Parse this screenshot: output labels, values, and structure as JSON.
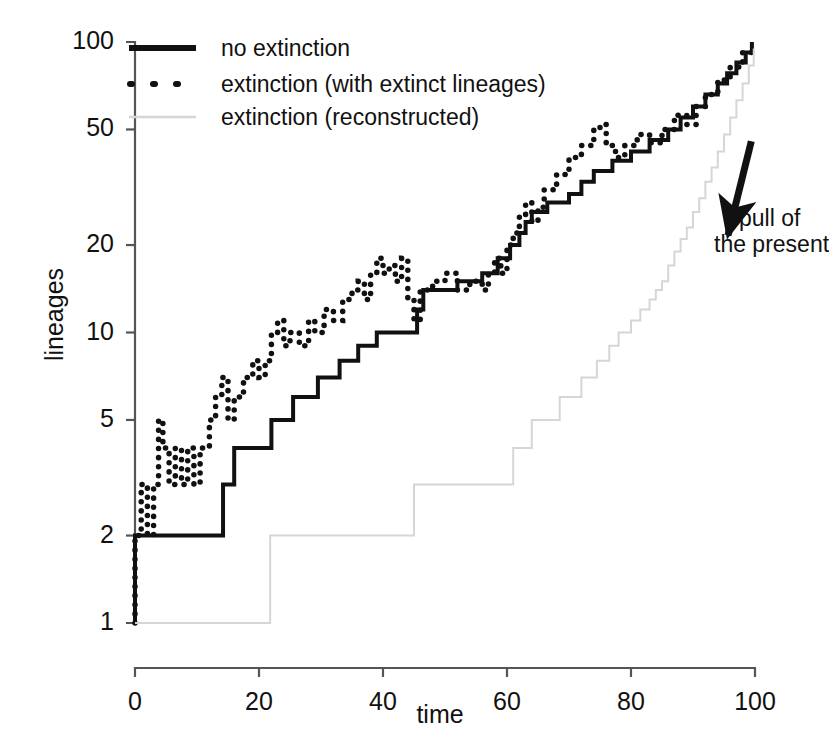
{
  "chart_data": {
    "type": "line",
    "title": "",
    "xlabel": "time",
    "ylabel": "lineages",
    "xlim": [
      0,
      100
    ],
    "ylim": [
      1,
      100
    ],
    "yscale": "log",
    "grid": false,
    "legend_position": "top-left",
    "xticks": [
      "0",
      "20",
      "40",
      "60",
      "80",
      "100"
    ],
    "xtick_values": [
      0,
      20,
      40,
      60,
      80,
      100
    ],
    "yticks": [
      "1",
      "2",
      "5",
      "10",
      "20",
      "50",
      "100"
    ],
    "ytick_values": [
      1,
      2,
      5,
      10,
      20,
      50,
      100
    ],
    "annotations": [
      {
        "name": "pull-of-the-present",
        "line1": "pull of",
        "line2": "the present",
        "arrow_from": [
          95,
          23
        ],
        "arrow_to": [
          96.5,
          47
        ]
      }
    ],
    "series": [
      {
        "name": "no extinction",
        "style": "solid",
        "color": "#111111",
        "width": 4,
        "step": true,
        "points": [
          [
            0,
            1
          ],
          [
            0,
            2
          ],
          [
            14.2,
            2
          ],
          [
            14.2,
            3
          ],
          [
            16.0,
            3
          ],
          [
            16.0,
            4
          ],
          [
            22.0,
            4
          ],
          [
            22.0,
            5
          ],
          [
            25.5,
            5
          ],
          [
            25.5,
            6
          ],
          [
            29.5,
            6
          ],
          [
            29.5,
            7
          ],
          [
            33.0,
            7
          ],
          [
            33.0,
            8
          ],
          [
            36.0,
            8
          ],
          [
            36.0,
            9
          ],
          [
            39.0,
            9
          ],
          [
            39.0,
            10
          ],
          [
            45.5,
            10
          ],
          [
            45.5,
            12
          ],
          [
            46.5,
            12
          ],
          [
            46.5,
            14
          ],
          [
            52.0,
            14
          ],
          [
            52.0,
            15
          ],
          [
            56.0,
            15
          ],
          [
            56.0,
            16
          ],
          [
            58.5,
            16
          ],
          [
            58.5,
            18
          ],
          [
            60.5,
            18
          ],
          [
            60.5,
            20
          ],
          [
            62.0,
            20
          ],
          [
            62.0,
            22
          ],
          [
            63.0,
            22
          ],
          [
            63.0,
            24
          ],
          [
            64.0,
            24
          ],
          [
            64.0,
            26
          ],
          [
            66.5,
            26
          ],
          [
            66.5,
            28
          ],
          [
            70.0,
            28
          ],
          [
            70.0,
            30
          ],
          [
            72.0,
            30
          ],
          [
            72.0,
            33
          ],
          [
            74.0,
            33
          ],
          [
            74.0,
            36
          ],
          [
            77.0,
            36
          ],
          [
            77.0,
            39
          ],
          [
            80.0,
            39
          ],
          [
            80.0,
            42
          ],
          [
            83.0,
            42
          ],
          [
            83.0,
            46
          ],
          [
            86.0,
            46
          ],
          [
            86.0,
            50
          ],
          [
            88.0,
            50
          ],
          [
            88.0,
            55
          ],
          [
            90.0,
            55
          ],
          [
            90.0,
            60
          ],
          [
            92.0,
            60
          ],
          [
            92.0,
            66
          ],
          [
            94.0,
            66
          ],
          [
            94.0,
            72
          ],
          [
            95.5,
            72
          ],
          [
            95.5,
            78
          ],
          [
            97.0,
            78
          ],
          [
            97.0,
            85
          ],
          [
            98.5,
            85
          ],
          [
            98.5,
            92
          ],
          [
            99.5,
            92
          ],
          [
            99.5,
            100
          ]
        ]
      },
      {
        "name": "extinction (with extinct lineages)",
        "style": "dotted",
        "color": "#111111",
        "width": 4,
        "step": true,
        "points": [
          [
            0,
            1
          ],
          [
            0,
            2
          ],
          [
            1.0,
            2
          ],
          [
            1.0,
            3
          ],
          [
            2.0,
            3
          ],
          [
            2.0,
            2
          ],
          [
            3.0,
            2
          ],
          [
            3.0,
            3
          ],
          [
            3.8,
            3
          ],
          [
            3.8,
            5
          ],
          [
            4.5,
            5
          ],
          [
            4.5,
            4
          ],
          [
            5.5,
            4
          ],
          [
            5.5,
            3
          ],
          [
            6.5,
            3
          ],
          [
            6.5,
            4
          ],
          [
            7.5,
            4
          ],
          [
            7.5,
            3
          ],
          [
            8.5,
            3
          ],
          [
            8.5,
            4
          ],
          [
            9.5,
            4
          ],
          [
            9.5,
            3
          ],
          [
            10.5,
            3
          ],
          [
            10.5,
            4
          ],
          [
            12.0,
            4
          ],
          [
            12.0,
            5
          ],
          [
            13.0,
            5
          ],
          [
            13.0,
            6
          ],
          [
            14.0,
            6
          ],
          [
            14.0,
            7
          ],
          [
            15.0,
            7
          ],
          [
            15.0,
            5
          ],
          [
            16.0,
            5
          ],
          [
            16.0,
            6
          ],
          [
            17.5,
            6
          ],
          [
            17.5,
            7
          ],
          [
            19.0,
            7
          ],
          [
            19.0,
            8
          ],
          [
            20.0,
            8
          ],
          [
            20.0,
            7
          ],
          [
            21.0,
            7
          ],
          [
            21.0,
            8
          ],
          [
            22.0,
            8
          ],
          [
            22.0,
            10
          ],
          [
            23.0,
            10
          ],
          [
            23.0,
            11
          ],
          [
            24.0,
            11
          ],
          [
            24.0,
            9
          ],
          [
            25.0,
            9
          ],
          [
            25.0,
            10
          ],
          [
            26.5,
            10
          ],
          [
            26.5,
            9
          ],
          [
            28.0,
            9
          ],
          [
            28.0,
            11
          ],
          [
            29.0,
            11
          ],
          [
            29.0,
            10
          ],
          [
            30.5,
            10
          ],
          [
            30.5,
            12
          ],
          [
            32.0,
            12
          ],
          [
            32.0,
            11
          ],
          [
            33.5,
            11
          ],
          [
            33.5,
            13
          ],
          [
            35.0,
            13
          ],
          [
            35.0,
            14
          ],
          [
            36.0,
            14
          ],
          [
            36.0,
            15
          ],
          [
            37.0,
            15
          ],
          [
            37.0,
            13
          ],
          [
            38.0,
            13
          ],
          [
            38.0,
            16
          ],
          [
            39.0,
            16
          ],
          [
            39.0,
            18
          ],
          [
            40.0,
            18
          ],
          [
            40.0,
            16
          ],
          [
            41.0,
            16
          ],
          [
            41.0,
            17
          ],
          [
            42.0,
            17
          ],
          [
            42.0,
            15
          ],
          [
            43.0,
            15
          ],
          [
            43.0,
            18
          ],
          [
            44.0,
            18
          ],
          [
            44.0,
            13
          ],
          [
            45.0,
            13
          ],
          [
            45.0,
            11
          ],
          [
            46.0,
            11
          ],
          [
            46.0,
            14
          ],
          [
            48.0,
            14
          ],
          [
            48.0,
            15
          ],
          [
            50.0,
            15
          ],
          [
            50.0,
            16
          ],
          [
            52.0,
            16
          ],
          [
            52.0,
            14
          ],
          [
            54.0,
            14
          ],
          [
            54.0,
            15
          ],
          [
            56.0,
            15
          ],
          [
            56.0,
            14
          ],
          [
            57.0,
            14
          ],
          [
            57.0,
            16
          ],
          [
            58.0,
            16
          ],
          [
            58.0,
            18
          ],
          [
            59.0,
            18
          ],
          [
            59.0,
            16
          ],
          [
            60.0,
            16
          ],
          [
            60.0,
            20
          ],
          [
            61.0,
            20
          ],
          [
            61.0,
            22
          ],
          [
            62.0,
            22
          ],
          [
            62.0,
            25
          ],
          [
            63.0,
            25
          ],
          [
            63.0,
            28
          ],
          [
            64.0,
            28
          ],
          [
            64.0,
            24
          ],
          [
            65.0,
            24
          ],
          [
            65.0,
            27
          ],
          [
            66.0,
            27
          ],
          [
            66.0,
            31
          ],
          [
            68.0,
            31
          ],
          [
            68.0,
            35
          ],
          [
            70.0,
            35
          ],
          [
            70.0,
            40
          ],
          [
            72.0,
            40
          ],
          [
            72.0,
            44
          ],
          [
            74.0,
            44
          ],
          [
            74.0,
            50
          ],
          [
            75.0,
            50
          ],
          [
            75.0,
            52
          ],
          [
            76.0,
            52
          ],
          [
            76.0,
            44
          ],
          [
            77.5,
            44
          ],
          [
            77.5,
            40
          ],
          [
            79.0,
            40
          ],
          [
            79.0,
            44
          ],
          [
            81.0,
            44
          ],
          [
            81.0,
            48
          ],
          [
            83.0,
            48
          ],
          [
            83.0,
            45
          ],
          [
            85.0,
            45
          ],
          [
            85.0,
            50
          ],
          [
            87.0,
            50
          ],
          [
            87.0,
            56
          ],
          [
            89.0,
            56
          ],
          [
            89.0,
            52
          ],
          [
            90.5,
            52
          ],
          [
            90.5,
            60
          ],
          [
            92.0,
            60
          ],
          [
            92.0,
            66
          ],
          [
            94.0,
            66
          ],
          [
            94.0,
            74
          ],
          [
            96.0,
            74
          ],
          [
            96.0,
            82
          ],
          [
            98.0,
            82
          ],
          [
            98.0,
            92
          ],
          [
            99.5,
            92
          ],
          [
            99.5,
            98
          ]
        ]
      },
      {
        "name": "extinction (reconstructed)",
        "style": "solid",
        "color": "#d6d6d6",
        "width": 2,
        "step": true,
        "points": [
          [
            0,
            1
          ],
          [
            21.8,
            1
          ],
          [
            21.8,
            2
          ],
          [
            45.0,
            2
          ],
          [
            45.0,
            3
          ],
          [
            61.0,
            3
          ],
          [
            61.0,
            4
          ],
          [
            64.0,
            4
          ],
          [
            64.0,
            5
          ],
          [
            68.5,
            5
          ],
          [
            68.5,
            6
          ],
          [
            72.0,
            6
          ],
          [
            72.0,
            7
          ],
          [
            74.5,
            7
          ],
          [
            74.5,
            8
          ],
          [
            76.5,
            8
          ],
          [
            76.5,
            9
          ],
          [
            78.0,
            9
          ],
          [
            78.0,
            10
          ],
          [
            80.0,
            10
          ],
          [
            80.0,
            11
          ],
          [
            81.5,
            11
          ],
          [
            81.5,
            12
          ],
          [
            83.0,
            12
          ],
          [
            83.0,
            13
          ],
          [
            84.0,
            13
          ],
          [
            84.0,
            14
          ],
          [
            85.0,
            14
          ],
          [
            85.0,
            15
          ],
          [
            86.0,
            15
          ],
          [
            86.0,
            17
          ],
          [
            87.0,
            17
          ],
          [
            87.0,
            19
          ],
          [
            88.0,
            19
          ],
          [
            88.0,
            21
          ],
          [
            89.0,
            21
          ],
          [
            89.0,
            23
          ],
          [
            90.0,
            23
          ],
          [
            90.0,
            26
          ],
          [
            91.0,
            26
          ],
          [
            91.0,
            29
          ],
          [
            92.0,
            29
          ],
          [
            92.0,
            33
          ],
          [
            93.0,
            33
          ],
          [
            93.0,
            37
          ],
          [
            94.0,
            37
          ],
          [
            94.0,
            42
          ],
          [
            95.0,
            42
          ],
          [
            95.0,
            48
          ],
          [
            96.0,
            48
          ],
          [
            96.0,
            55
          ],
          [
            97.0,
            55
          ],
          [
            97.0,
            63
          ],
          [
            98.0,
            63
          ],
          [
            98.0,
            72
          ],
          [
            99.0,
            72
          ],
          [
            99.0,
            83
          ],
          [
            99.8,
            83
          ],
          [
            99.8,
            95
          ]
        ]
      }
    ]
  },
  "legend": {
    "items": [
      {
        "label": "no extinction",
        "swatch": "solid-thick-black"
      },
      {
        "label": "extinction (with extinct lineages)",
        "swatch": "dotted-black"
      },
      {
        "label": "extinction (reconstructed)",
        "swatch": "solid-thin-gray"
      }
    ]
  },
  "colors": {
    "foreground": "#111111",
    "reconstructed": "#d6d6d6",
    "background": "#ffffff"
  }
}
